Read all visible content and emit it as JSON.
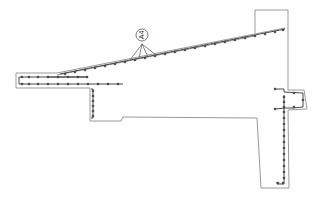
{
  "diagram": {
    "type": "reinforced-concrete-cross-section",
    "colors": {
      "outline": "#9a9a9a",
      "rebar": "#4a4a4a",
      "bar_dot": "#3a3a3a",
      "background": "#ffffff"
    },
    "callout": {
      "label": "A4",
      "orientation": "rotated-90",
      "leader_count": 4
    }
  }
}
